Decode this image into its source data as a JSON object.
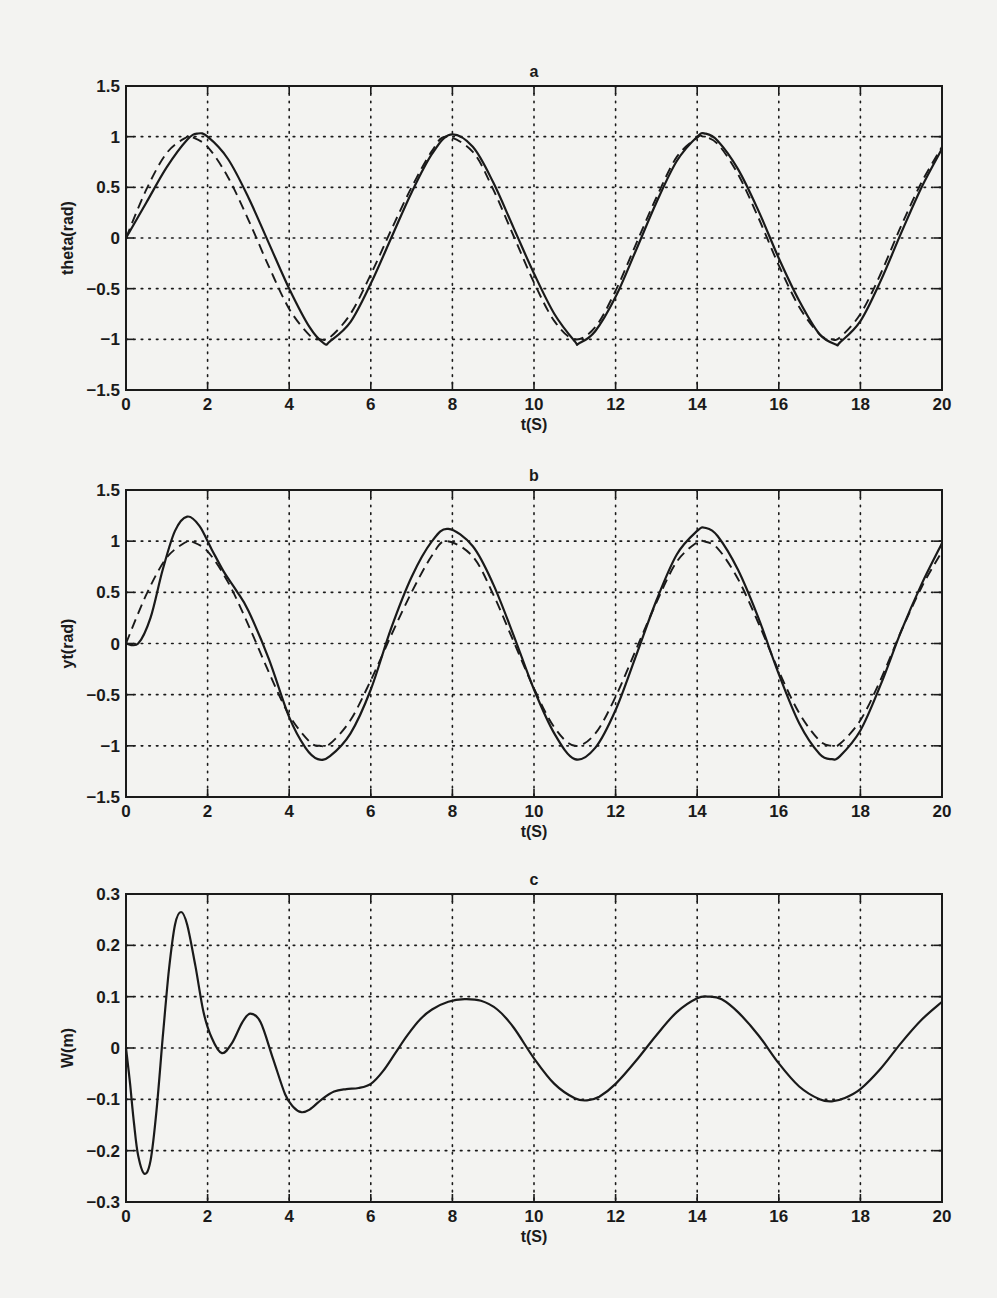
{
  "figure": {
    "background": "#f3f3f1",
    "line_color": "#1a1a1a",
    "grid_style": "dotted"
  },
  "chart_data": [
    {
      "type": "line",
      "title": "a",
      "xlabel": "t(S)",
      "ylabel": "theta(rad)",
      "xlim": [
        0,
        20
      ],
      "ylim": [
        -1.5,
        1.5
      ],
      "xticks": [
        "0",
        "2",
        "4",
        "6",
        "8",
        "10",
        "12",
        "14",
        "16",
        "18",
        "20"
      ],
      "yticks": [
        "-1.5",
        "-1",
        "-0.5",
        "0",
        "0.5",
        "1",
        "1.5"
      ],
      "grid": true,
      "series": [
        {
          "name": "actual",
          "style": "solid",
          "x": [
            0,
            0.5,
            1,
            1.5,
            1.75,
            2,
            2.5,
            3,
            3.5,
            4,
            4.5,
            4.85,
            5,
            5.5,
            6,
            6.5,
            7,
            7.5,
            7.95,
            8.5,
            9,
            9.5,
            10,
            10.5,
            11,
            11.1,
            11.5,
            12,
            12.5,
            13,
            13.5,
            14,
            14.2,
            14.5,
            15,
            15.5,
            16,
            16.5,
            17,
            17.4,
            17.5,
            18,
            18.5,
            19,
            19.5,
            20
          ],
          "y": [
            0,
            0.35,
            0.7,
            0.97,
            1.03,
            1.0,
            0.78,
            0.4,
            -0.05,
            -0.5,
            -0.88,
            -1.04,
            -1.02,
            -0.83,
            -0.45,
            0.0,
            0.45,
            0.83,
            1.02,
            0.9,
            0.55,
            0.1,
            -0.35,
            -0.75,
            -1.02,
            -1.04,
            -0.92,
            -0.58,
            -0.12,
            0.35,
            0.76,
            1.0,
            1.03,
            0.96,
            0.68,
            0.27,
            -0.2,
            -0.62,
            -0.95,
            -1.05,
            -1.03,
            -0.82,
            -0.42,
            0.05,
            0.5,
            0.88
          ]
        },
        {
          "name": "reference",
          "style": "dashed",
          "x": [
            0,
            0.5,
            1,
            1.5,
            1.6,
            2,
            2.5,
            3,
            3.5,
            4,
            4.5,
            4.75,
            5,
            5.5,
            6,
            6.5,
            7,
            7.5,
            7.85,
            8.5,
            9,
            9.5,
            10,
            10.5,
            11,
            11.5,
            12,
            12.5,
            13,
            13.5,
            14,
            14.15,
            14.5,
            15,
            15.5,
            16,
            16.5,
            17,
            17.3,
            17.5,
            18,
            18.5,
            19,
            19.5,
            20
          ],
          "y": [
            0,
            0.48,
            0.84,
            1.0,
            1.0,
            0.9,
            0.6,
            0.18,
            -0.28,
            -0.7,
            -0.96,
            -1.0,
            -0.98,
            -0.75,
            -0.36,
            0.08,
            0.5,
            0.86,
            1.0,
            0.85,
            0.48,
            0.02,
            -0.44,
            -0.82,
            -1.0,
            -0.88,
            -0.52,
            -0.06,
            0.4,
            0.8,
            0.99,
            1.0,
            0.93,
            0.63,
            0.2,
            -0.27,
            -0.68,
            -0.95,
            -1.0,
            -0.98,
            -0.75,
            -0.35,
            0.12,
            0.55,
            0.9
          ]
        }
      ]
    },
    {
      "type": "line",
      "title": "b",
      "xlabel": "t(S)",
      "ylabel": "yt(rad)",
      "xlim": [
        0,
        20
      ],
      "ylim": [
        -1.5,
        1.5
      ],
      "xticks": [
        "0",
        "2",
        "4",
        "6",
        "8",
        "10",
        "12",
        "14",
        "16",
        "18",
        "20"
      ],
      "yticks": [
        "-1.5",
        "-1",
        "-0.5",
        "0",
        "0.5",
        "1",
        "1.5"
      ],
      "grid": true,
      "series": [
        {
          "name": "actual",
          "style": "solid",
          "x": [
            0,
            0.3,
            0.6,
            0.9,
            1.2,
            1.5,
            1.8,
            2.1,
            2.4,
            2.7,
            3.0,
            3.5,
            4,
            4.4,
            4.7,
            5,
            5.5,
            6,
            6.5,
            7,
            7.5,
            7.9,
            8.5,
            9,
            9.5,
            10,
            10.5,
            11,
            11.5,
            12,
            12.5,
            13,
            13.5,
            14,
            14.2,
            14.5,
            15,
            15.5,
            16,
            16.5,
            17,
            17.3,
            17.5,
            18,
            18.5,
            19,
            19.5,
            20
          ],
          "y": [
            0,
            0.0,
            0.25,
            0.72,
            1.1,
            1.24,
            1.15,
            0.92,
            0.7,
            0.52,
            0.32,
            -0.15,
            -0.72,
            -1.02,
            -1.13,
            -1.1,
            -0.88,
            -0.45,
            0.15,
            0.65,
            1.0,
            1.12,
            0.95,
            0.58,
            0.08,
            -0.45,
            -0.88,
            -1.13,
            -1.02,
            -0.65,
            -0.12,
            0.42,
            0.87,
            1.1,
            1.13,
            1.05,
            0.72,
            0.25,
            -0.3,
            -0.78,
            -1.08,
            -1.13,
            -1.1,
            -0.85,
            -0.4,
            0.12,
            0.58,
            0.98
          ]
        },
        {
          "name": "reference",
          "style": "dashed",
          "x": [
            0,
            0.5,
            1,
            1.5,
            1.6,
            2,
            2.5,
            3,
            3.5,
            4,
            4.5,
            4.75,
            5,
            5.5,
            6,
            6.5,
            7,
            7.5,
            7.85,
            8.5,
            9,
            9.5,
            10,
            10.5,
            11,
            11.5,
            12,
            12.5,
            13,
            13.5,
            14,
            14.15,
            14.5,
            15,
            15.5,
            16,
            16.5,
            17,
            17.3,
            17.5,
            18,
            18.5,
            19,
            19.5,
            20
          ],
          "y": [
            0,
            0.48,
            0.84,
            1.0,
            1.0,
            0.9,
            0.6,
            0.18,
            -0.28,
            -0.7,
            -0.96,
            -1.0,
            -0.98,
            -0.75,
            -0.36,
            0.08,
            0.5,
            0.86,
            1.0,
            0.85,
            0.48,
            0.02,
            -0.44,
            -0.82,
            -1.0,
            -0.88,
            -0.52,
            -0.06,
            0.4,
            0.8,
            0.99,
            1.0,
            0.93,
            0.63,
            0.2,
            -0.27,
            -0.68,
            -0.95,
            -1.0,
            -0.98,
            -0.75,
            -0.35,
            0.12,
            0.55,
            0.9
          ]
        }
      ]
    },
    {
      "type": "line",
      "title": "c",
      "xlabel": "t(S)",
      "ylabel": "W(m)",
      "xlim": [
        0,
        20
      ],
      "ylim": [
        -0.3,
        0.3
      ],
      "xticks": [
        "0",
        "2",
        "4",
        "6",
        "8",
        "10",
        "12",
        "14",
        "16",
        "18",
        "20"
      ],
      "yticks": [
        "-0.3",
        "-0.2",
        "-0.1",
        "0",
        "0.1",
        "0.2",
        "0.3"
      ],
      "grid": true,
      "series": [
        {
          "name": "W",
          "style": "solid",
          "x": [
            0,
            0.1,
            0.2,
            0.3,
            0.45,
            0.6,
            0.75,
            0.9,
            1.05,
            1.2,
            1.35,
            1.5,
            1.7,
            1.9,
            2.1,
            2.35,
            2.6,
            2.85,
            3.05,
            3.3,
            3.6,
            3.9,
            4.1,
            4.3,
            4.5,
            4.8,
            5.1,
            5.4,
            5.7,
            6.0,
            6.3,
            6.6,
            6.9,
            7.2,
            7.5,
            7.9,
            8.3,
            8.7,
            9.1,
            9.5,
            10,
            10.5,
            11,
            11.3,
            11.6,
            12,
            12.5,
            13,
            13.5,
            14,
            14.3,
            14.6,
            15,
            15.5,
            16,
            16.5,
            17,
            17.3,
            17.6,
            18,
            18.5,
            19,
            19.5,
            20
          ],
          "y": [
            0,
            -0.07,
            -0.15,
            -0.21,
            -0.245,
            -0.22,
            -0.12,
            0.02,
            0.15,
            0.24,
            0.265,
            0.24,
            0.16,
            0.07,
            0.02,
            -0.01,
            0.01,
            0.05,
            0.067,
            0.05,
            -0.02,
            -0.09,
            -0.115,
            -0.125,
            -0.12,
            -0.1,
            -0.085,
            -0.08,
            -0.078,
            -0.07,
            -0.045,
            -0.01,
            0.025,
            0.055,
            0.075,
            0.09,
            0.095,
            0.092,
            0.075,
            0.04,
            -0.02,
            -0.07,
            -0.098,
            -0.102,
            -0.095,
            -0.07,
            -0.025,
            0.025,
            0.07,
            0.097,
            0.1,
            0.095,
            0.07,
            0.025,
            -0.03,
            -0.075,
            -0.1,
            -0.104,
            -0.098,
            -0.08,
            -0.04,
            0.01,
            0.055,
            0.09
          ]
        }
      ]
    }
  ]
}
